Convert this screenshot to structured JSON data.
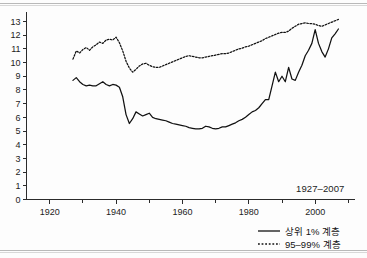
{
  "chart_data": {
    "type": "line",
    "title": "",
    "subtitle": "",
    "xlabel": "",
    "ylabel": "",
    "annotation": "1927–2007",
    "xlim": [
      1913,
      2012
    ],
    "ylim": [
      0,
      13.4
    ],
    "grid": false,
    "legend_position": "bottom-right",
    "xticks": [
      1920,
      1940,
      1960,
      1980,
      2000
    ],
    "xtick_labels": [
      "1920",
      "1940",
      "1960",
      "1980",
      "2000"
    ],
    "xminor_ticks": [
      1930,
      1950,
      1970,
      1990,
      2010
    ],
    "yticks": [
      0,
      1,
      2,
      3,
      4,
      5,
      6,
      7,
      8,
      9,
      10,
      11,
      12,
      13
    ],
    "ytick_labels": [
      "0",
      "1",
      "2",
      "3",
      "4",
      "5",
      "6",
      "7",
      "8",
      "9",
      "10",
      "11",
      "12",
      "13"
    ],
    "x": [
      1927,
      1928,
      1929,
      1930,
      1931,
      1932,
      1933,
      1934,
      1935,
      1936,
      1937,
      1938,
      1939,
      1940,
      1941,
      1942,
      1943,
      1944,
      1945,
      1946,
      1947,
      1948,
      1949,
      1950,
      1951,
      1952,
      1953,
      1954,
      1955,
      1956,
      1957,
      1958,
      1959,
      1960,
      1961,
      1962,
      1963,
      1964,
      1965,
      1966,
      1967,
      1968,
      1969,
      1970,
      1971,
      1972,
      1973,
      1974,
      1975,
      1976,
      1977,
      1978,
      1979,
      1980,
      1981,
      1982,
      1983,
      1984,
      1985,
      1986,
      1987,
      1988,
      1989,
      1990,
      1991,
      1992,
      1993,
      1994,
      1995,
      1996,
      1997,
      1998,
      1999,
      2000,
      2001,
      2002,
      2003,
      2004,
      2005,
      2006,
      2007
    ],
    "series": [
      {
        "name": "상위 1% 계층",
        "style": "solid",
        "values": [
          8.7,
          8.9,
          8.6,
          8.4,
          8.3,
          8.35,
          8.3,
          8.3,
          8.45,
          8.6,
          8.4,
          8.3,
          8.4,
          8.35,
          8.2,
          7.5,
          6.2,
          5.55,
          5.9,
          6.4,
          6.25,
          6.1,
          6.2,
          6.3,
          6.0,
          5.9,
          5.85,
          5.8,
          5.75,
          5.65,
          5.55,
          5.5,
          5.45,
          5.4,
          5.35,
          5.25,
          5.2,
          5.15,
          5.15,
          5.2,
          5.35,
          5.3,
          5.2,
          5.15,
          5.2,
          5.3,
          5.3,
          5.4,
          5.5,
          5.6,
          5.75,
          5.85,
          6.0,
          6.2,
          6.4,
          6.5,
          6.7,
          7.0,
          7.3,
          7.3,
          8.3,
          9.3,
          8.6,
          9.0,
          8.6,
          9.65,
          8.8,
          8.7,
          9.3,
          9.8,
          10.5,
          10.9,
          11.4,
          12.4,
          11.4,
          10.8,
          10.4,
          11.0,
          11.8,
          12.1,
          12.45
        ]
      },
      {
        "name": "95–99% 계층",
        "style": "dotted",
        "values": [
          10.25,
          10.85,
          10.7,
          10.95,
          11.1,
          10.9,
          11.15,
          11.3,
          11.5,
          11.4,
          11.65,
          11.7,
          11.65,
          11.85,
          11.45,
          10.85,
          10.1,
          9.6,
          9.3,
          9.5,
          9.75,
          9.9,
          9.95,
          9.8,
          9.7,
          9.65,
          9.65,
          9.75,
          9.85,
          9.95,
          10.05,
          10.15,
          10.25,
          10.35,
          10.45,
          10.5,
          10.45,
          10.4,
          10.35,
          10.35,
          10.4,
          10.45,
          10.5,
          10.55,
          10.6,
          10.65,
          10.65,
          10.7,
          10.8,
          10.9,
          11.0,
          11.05,
          11.15,
          11.2,
          11.3,
          11.4,
          11.5,
          11.6,
          11.75,
          11.85,
          11.95,
          12.05,
          12.15,
          12.2,
          12.2,
          12.3,
          12.5,
          12.65,
          12.8,
          12.85,
          12.9,
          12.85,
          12.85,
          12.8,
          12.7,
          12.65,
          12.75,
          12.85,
          12.95,
          13.05,
          13.15
        ]
      }
    ],
    "legend": [
      {
        "label": "상위 1% 계층",
        "style": "solid"
      },
      {
        "label": "95–99% 계층",
        "style": "dotted"
      }
    ]
  },
  "colors": {
    "line": "#111111",
    "axis": "#2b2b2b",
    "text": "#1c1c1c",
    "background": "#fdfdfd",
    "frame_rule": "#b9b9b9"
  }
}
